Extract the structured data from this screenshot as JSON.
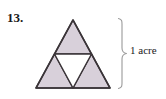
{
  "figure": {
    "problem_number": "13.",
    "brace_label": "1 acre",
    "shape_name": "sierpinski-triangle",
    "colors": {
      "shaded_fill": "#d8d0da",
      "outline": "#3a3438",
      "center_fill": "#ffffff",
      "brace_stroke": "#8c8c8c",
      "text": "#1a1a1a",
      "background": "#ffffff"
    },
    "triangle": {
      "apex": [
        73,
        20
      ],
      "base_left": [
        36,
        88
      ],
      "base_right": [
        110,
        88
      ],
      "midline_left": [
        54.5,
        54
      ],
      "midline_right": [
        91.5,
        54
      ],
      "base_mid": [
        73,
        88
      ]
    },
    "sub_triangles": [
      {
        "name": "top-shaded-triangle",
        "shaded": true
      },
      {
        "name": "bottom-left-shaded-triangle",
        "shaded": true
      },
      {
        "name": "bottom-right-shaded-triangle",
        "shaded": true
      },
      {
        "name": "center-inverted-white-triangle",
        "shaded": false
      }
    ],
    "brace": {
      "top_y": 18,
      "bottom_y": 89,
      "spine_x": 122,
      "tip_x": 128,
      "mid_y": 53.5
    }
  }
}
